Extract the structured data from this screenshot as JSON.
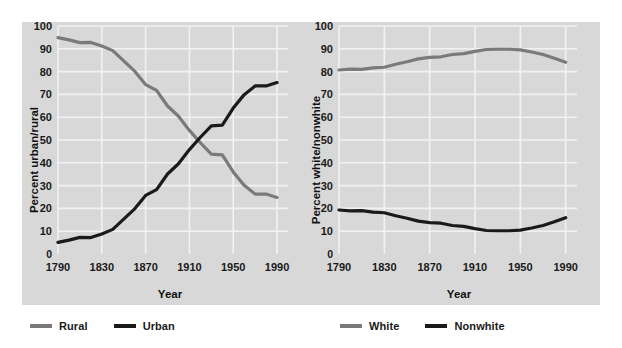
{
  "figure": {
    "background_color": "#d8d8d8",
    "page_color": "#ffffff"
  },
  "colors": {
    "gray_series": "#7a7a7a",
    "black_series": "#1a1a1a",
    "gridline": "#f2f2f2",
    "text": "#1a1a1a"
  },
  "chart_data": [
    {
      "type": "line",
      "title": "",
      "xlabel": "Year",
      "ylabel": "Percent urban/rural",
      "xlim": [
        1790,
        2000
      ],
      "ylim": [
        0,
        100
      ],
      "xticks": [
        "1790",
        "1830",
        "1870",
        "1910",
        "1950",
        "1990"
      ],
      "xtick_values": [
        1790,
        1830,
        1870,
        1910,
        1950,
        1990
      ],
      "yticks": [
        "0",
        "10",
        "20",
        "30",
        "40",
        "50",
        "60",
        "70",
        "80",
        "90",
        "100"
      ],
      "ytick_values": [
        0,
        10,
        20,
        30,
        40,
        50,
        60,
        70,
        80,
        90,
        100
      ],
      "grid": true,
      "legend_position": "below-left",
      "x": [
        1790,
        1800,
        1810,
        1820,
        1830,
        1840,
        1850,
        1860,
        1870,
        1880,
        1890,
        1900,
        1910,
        1920,
        1930,
        1940,
        1950,
        1960,
        1970,
        1980,
        1990
      ],
      "series": [
        {
          "name": "Rural",
          "color": "#7a7a7a",
          "values": [
            94.9,
            93.9,
            92.7,
            92.8,
            91.2,
            89.2,
            84.7,
            80.2,
            74.3,
            71.8,
            64.9,
            60.4,
            54.2,
            48.8,
            43.8,
            43.5,
            36.0,
            30.1,
            26.3,
            26.3,
            24.8
          ]
        },
        {
          "name": "Urban",
          "color": "#1a1a1a",
          "values": [
            5.1,
            6.1,
            7.3,
            7.2,
            8.8,
            10.8,
            15.3,
            19.8,
            25.7,
            28.2,
            35.1,
            39.6,
            45.8,
            51.2,
            56.2,
            56.5,
            64.0,
            69.9,
            73.7,
            73.7,
            75.2
          ]
        }
      ]
    },
    {
      "type": "line",
      "title": "",
      "xlabel": "Year",
      "ylabel": "Percent white/nonwhite",
      "xlim": [
        1790,
        2000
      ],
      "ylim": [
        0,
        100
      ],
      "xticks": [
        "1790",
        "1830",
        "1870",
        "1910",
        "1950",
        "1990"
      ],
      "xtick_values": [
        1790,
        1830,
        1870,
        1910,
        1950,
        1990
      ],
      "yticks": [
        "0",
        "10",
        "20",
        "30",
        "40",
        "50",
        "60",
        "70",
        "80",
        "90",
        "100"
      ],
      "ytick_values": [
        0,
        10,
        20,
        30,
        40,
        50,
        60,
        70,
        80,
        90,
        100
      ],
      "grid": true,
      "legend_position": "below-right",
      "x": [
        1790,
        1800,
        1810,
        1820,
        1830,
        1840,
        1850,
        1860,
        1870,
        1880,
        1890,
        1900,
        1910,
        1920,
        1930,
        1940,
        1950,
        1960,
        1970,
        1980,
        1990
      ],
      "series": [
        {
          "name": "White",
          "color": "#7a7a7a",
          "values": [
            80.7,
            81.1,
            81.0,
            81.6,
            81.9,
            83.2,
            84.3,
            85.6,
            86.2,
            86.5,
            87.5,
            87.9,
            88.9,
            89.7,
            89.8,
            89.8,
            89.5,
            88.6,
            87.5,
            85.9,
            84.1
          ]
        },
        {
          "name": "Nonwhite",
          "color": "#1a1a1a",
          "values": [
            19.3,
            18.9,
            19.0,
            18.4,
            18.1,
            16.8,
            15.7,
            14.4,
            13.8,
            13.5,
            12.5,
            12.1,
            11.1,
            10.3,
            10.2,
            10.2,
            10.5,
            11.4,
            12.5,
            14.1,
            15.9
          ]
        }
      ]
    }
  ],
  "legends": [
    {
      "id": "urban-rural-legend",
      "items": [
        {
          "label": "Rural",
          "color": "#7a7a7a"
        },
        {
          "label": "Urban",
          "color": "#1a1a1a"
        }
      ]
    },
    {
      "id": "white-nonwhite-legend",
      "items": [
        {
          "label": "White",
          "color": "#7a7a7a"
        },
        {
          "label": "Nonwhite",
          "color": "#1a1a1a"
        }
      ]
    }
  ]
}
